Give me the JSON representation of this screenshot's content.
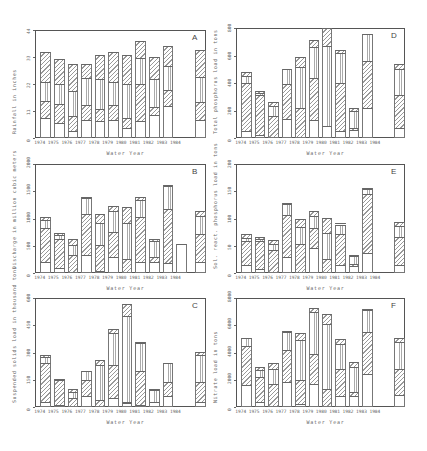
{
  "figure": {
    "x_tick_labels": [
      "1974",
      "1975",
      "1976",
      "1977",
      "1978",
      "1979",
      "1980",
      "1981",
      "1982",
      "1983",
      "1984"
    ],
    "extra_bar_note": "rightmost bar (unlabeled, likely mean)"
  },
  "chart_data": [
    {
      "id": "A",
      "type": "bar",
      "stacked": true,
      "title": "A",
      "xlabel": "Water Year",
      "ylabel": "Rainfall in inches",
      "ylim": [
        0,
        44
      ],
      "yticks": [
        "0",
        "11",
        "22",
        "33",
        "44"
      ],
      "categories": [
        "1974",
        "1975",
        "1976",
        "1977",
        "1978",
        "1979",
        "1980",
        "1981",
        "1982",
        "1983",
        "1984",
        "Mean"
      ],
      "series": [
        {
          "name": "segment-1 (blank)",
          "values": [
            8,
            6,
            3,
            7.5,
            7,
            7.5,
            4,
            7,
            9.5,
            13,
            0,
            7.5
          ]
        },
        {
          "name": "segment-2 (diagonal hatch)",
          "values": [
            7,
            8,
            6,
            6,
            5,
            6,
            4,
            15,
            3,
            6.5,
            0,
            7
          ]
        },
        {
          "name": "segment-3 (vertical hatch)",
          "values": [
            8,
            8,
            10,
            11,
            12,
            9.5,
            14,
            10.5,
            11.5,
            10,
            0,
            10.5
          ]
        },
        {
          "name": "segment-4 (diagonal hatch)",
          "values": [
            12,
            10,
            11,
            5.5,
            10,
            12,
            12,
            7,
            9,
            8,
            0,
            11
          ]
        }
      ]
    },
    {
      "id": "B",
      "type": "bar",
      "stacked": true,
      "title": "B",
      "xlabel": "Water Year",
      "ylabel": "Discharge in million cubic meters",
      "ylim": [
        0,
        2000
      ],
      "yticks": [
        "0",
        "500",
        "1000",
        "1500",
        "2000"
      ],
      "categories": [
        "1974",
        "1975",
        "1976",
        "1977",
        "1978",
        "1979",
        "1980",
        "1981",
        "1982",
        "1983",
        "1984",
        "Mean"
      ],
      "series": [
        {
          "name": "segment-1 (blank)",
          "values": [
            200,
            90,
            10,
            330,
            40,
            300,
            20,
            200,
            200,
            180,
            540,
            200
          ]
        },
        {
          "name": "segment-2 (diagonal hatch)",
          "values": [
            630,
            530,
            320,
            750,
            470,
            460,
            230,
            820,
            90,
            1000,
            0,
            520
          ]
        },
        {
          "name": "segment-3 (vertical hatch)",
          "values": [
            140,
            70,
            190,
            300,
            400,
            370,
            660,
            320,
            300,
            420,
            0,
            320
          ]
        },
        {
          "name": "segment-4 (diagonal hatch)",
          "values": [
            60,
            40,
            110,
            20,
            170,
            100,
            300,
            60,
            40,
            20,
            0,
            90
          ]
        }
      ]
    },
    {
      "id": "C",
      "type": "bar",
      "stacked": true,
      "title": "C",
      "xlabel": "Water Year",
      "ylabel": "Suspended solids load in thousand tons",
      "ylim": [
        0,
        600
      ],
      "yticks": [
        "0",
        "150",
        "300",
        "450",
        "600"
      ],
      "categories": [
        "1974",
        "1975",
        "1976",
        "1977",
        "1978",
        "1979",
        "1980",
        "1981",
        "1982",
        "1983",
        "1984",
        "Mean"
      ],
      "series": [
        {
          "name": "segment-1 (blank)",
          "values": [
            30,
            10,
            0,
            60,
            0,
            50,
            20,
            10,
            25,
            60,
            0,
            25
          ]
        },
        {
          "name": "segment-2 (diagonal hatch)",
          "values": [
            210,
            140,
            50,
            90,
            40,
            180,
            10,
            190,
            5,
            80,
            0,
            110
          ]
        },
        {
          "name": "segment-3 (vertical hatch)",
          "values": [
            35,
            0,
            30,
            50,
            190,
            180,
            470,
            150,
            65,
            100,
            0,
            150
          ]
        },
        {
          "name": "segment-4 (diagonal hatch)",
          "values": [
            10,
            5,
            20,
            0,
            30,
            20,
            65,
            10,
            5,
            0,
            0,
            20
          ]
        }
      ]
    },
    {
      "id": "D",
      "type": "bar",
      "stacked": true,
      "title": "D",
      "xlabel": "Water Year",
      "ylabel": "Total phosphorus load in tons",
      "ylim": [
        0,
        800
      ],
      "yticks": [
        "0",
        "200",
        "400",
        "600",
        "800"
      ],
      "categories": [
        "1974",
        "1975",
        "1976",
        "1977",
        "1978",
        "1979",
        "1980",
        "1981",
        "1982",
        "1983",
        "1984",
        "Mean"
      ],
      "series": [
        {
          "name": "segment-1 (blank)",
          "values": [
            50,
            25,
            0,
            140,
            10,
            130,
            90,
            50,
            55,
            220,
            0,
            70
          ]
        },
        {
          "name": "segment-2 (diagonal hatch)",
          "values": [
            350,
            290,
            160,
            250,
            210,
            310,
            0,
            350,
            15,
            340,
            0,
            240
          ]
        },
        {
          "name": "segment-3 (vertical hatch)",
          "values": [
            50,
            10,
            70,
            110,
            300,
            220,
            580,
            220,
            130,
            200,
            0,
            190
          ]
        },
        {
          "name": "segment-4 (diagonal hatch)",
          "values": [
            30,
            20,
            35,
            0,
            70,
            50,
            130,
            20,
            20,
            0,
            0,
            40
          ]
        }
      ]
    },
    {
      "id": "E",
      "type": "bar",
      "stacked": true,
      "title": "E",
      "xlabel": "Water Year",
      "ylabel": "Sol. react. phosphorus load in tons",
      "ylim": [
        0,
        200
      ],
      "yticks": [
        "0",
        "50",
        "100",
        "150",
        "200"
      ],
      "categories": [
        "1974",
        "1975",
        "1976",
        "1977",
        "1978",
        "1979",
        "1980",
        "1981",
        "1982",
        "1983",
        "1984",
        "Mean"
      ],
      "series": [
        {
          "name": "segment-1 (blank)",
          "values": [
            15,
            8,
            0,
            30,
            2,
            45,
            2,
            14,
            12,
            36,
            0,
            15
          ]
        },
        {
          "name": "segment-2 (diagonal hatch)",
          "values": [
            43,
            50,
            43,
            77,
            51,
            37,
            23,
            58,
            5,
            109,
            0,
            51
          ]
        },
        {
          "name": "segment-3 (vertical hatch)",
          "values": [
            6,
            4,
            10,
            20,
            31,
            22,
            49,
            17,
            14,
            10,
            0,
            20
          ]
        },
        {
          "name": "segment-4 (diagonal hatch)",
          "values": [
            7,
            4,
            8,
            2,
            16,
            9,
            27,
            1,
            2,
            1,
            0,
            8
          ]
        }
      ]
    },
    {
      "id": "F",
      "type": "bar",
      "stacked": true,
      "title": "F",
      "xlabel": "Water Year",
      "ylabel": "Nitrate load in tons",
      "ylim": [
        0,
        8000
      ],
      "yticks": [
        "0",
        "2000",
        "4000",
        "6000",
        "8000"
      ],
      "categories": [
        "1974",
        "1975",
        "1976",
        "1977",
        "1978",
        "1979",
        "1980",
        "1981",
        "1982",
        "1983",
        "1984",
        "Mean"
      ],
      "series": [
        {
          "name": "segment-1 (blank)",
          "values": [
            1600,
            400,
            0,
            1800,
            200,
            1700,
            100,
            800,
            800,
            2400,
            0,
            900
          ]
        },
        {
          "name": "segment-2 (diagonal hatch)",
          "values": [
            2900,
            1800,
            1700,
            2400,
            1800,
            2200,
            1200,
            2000,
            300,
            3100,
            0,
            1900
          ]
        },
        {
          "name": "segment-3 (vertical hatch)",
          "values": [
            600,
            500,
            1100,
            1300,
            2900,
            3100,
            4800,
            1800,
            1800,
            1600,
            0,
            2000
          ]
        },
        {
          "name": "segment-4 (diagonal hatch)",
          "values": [
            0,
            200,
            400,
            100,
            500,
            300,
            700,
            400,
            400,
            100,
            0,
            300
          ]
        }
      ]
    }
  ]
}
